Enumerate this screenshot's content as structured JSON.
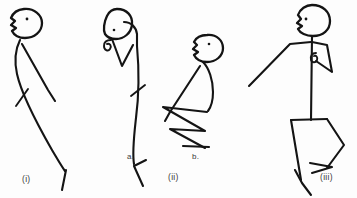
{
  "canvas": {
    "width": 357,
    "height": 198,
    "background_color": "#fdfdfd",
    "ink_color": "#141414",
    "description": "Hand-drawn pen sketch of four stick figures in a row showing postures"
  },
  "labels": {
    "fig_i": "(i)",
    "fig_ii_a": "a.",
    "fig_ii_b": "b.",
    "fig_ii": "(ii)",
    "fig_iii": "(iii)"
  },
  "figures": [
    {
      "id": "figure-i",
      "label": "(i)",
      "label_position": {
        "x": 22,
        "y": 182
      },
      "pose": "standing leaning, head tilted back facing left, one arm down-right, long curved leg with foot",
      "head": {
        "cx": 26,
        "cy": 23,
        "rx": 15,
        "ry": 14,
        "facing": "left",
        "eye": {
          "cx": 27,
          "cy": 19,
          "r": 1.3
        }
      }
    },
    {
      "id": "figure-ii-a",
      "label": "a.",
      "label_position": {
        "x": 127,
        "y": 159
      },
      "pose": "head bowed forward, arm curled at chin, long single curved leg with foot",
      "head": {
        "cx": 117,
        "cy": 25,
        "rx": 15,
        "ry": 14,
        "facing": "down-left",
        "eye": {
          "cx": 114,
          "cy": 30,
          "r": 1.3
        }
      }
    },
    {
      "id": "figure-ii-b",
      "label": "b.",
      "label_position": {
        "x": 192,
        "y": 159
      },
      "pose": "crouching, head up facing left, arm down-left, zigzag folded legs",
      "head": {
        "cx": 208,
        "cy": 48,
        "rx": 14,
        "ry": 13,
        "facing": "left",
        "eye": {
          "cx": 209,
          "cy": 44,
          "r": 1.3
        }
      }
    },
    {
      "id": "figure-iii",
      "label": "(iii)",
      "label_position": {
        "x": 322,
        "y": 180
      },
      "pose": "upright standing facing left, straight arm out down-left, bent arm with hand loop, angular legs",
      "head": {
        "cx": 311,
        "cy": 20,
        "rx": 15,
        "ry": 15,
        "facing": "left",
        "eye": {
          "cx": 306,
          "cy": 19,
          "r": 1.4
        }
      }
    }
  ],
  "caption_group": {
    "fig_ii_label": "(ii)",
    "fig_ii_label_position": {
      "x": 170,
      "y": 180
    }
  }
}
